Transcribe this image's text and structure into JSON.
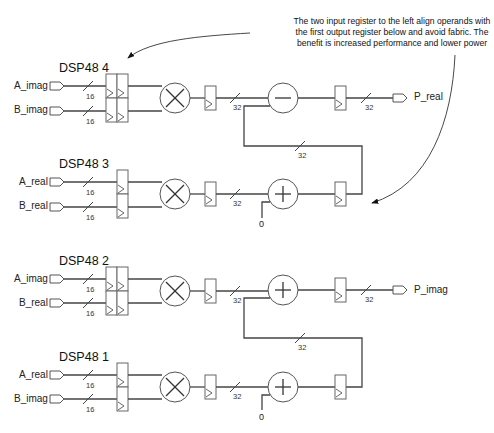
{
  "annotation": {
    "lines": [
      "The two input register to the left align operands with",
      "the first output register below and avoid fabric. The",
      "benefit is increased performance and lower power"
    ]
  },
  "blocks": [
    {
      "title": "DSP48 4",
      "inputs": [
        {
          "name": "A_imag",
          "width": "16"
        },
        {
          "name": "B_imag",
          "width": "16"
        }
      ],
      "input_register_stages": 2,
      "operation": "multiply",
      "product_width": "32",
      "accumulate_operation": "subtract",
      "output": {
        "name": "P_real",
        "width": "32"
      }
    },
    {
      "title": "DSP48 3",
      "inputs": [
        {
          "name": "A_real",
          "width": "16"
        },
        {
          "name": "B_real",
          "width": "16"
        }
      ],
      "input_register_stages": 1,
      "operation": "multiply",
      "product_width": "32",
      "accumulate_operation": "add",
      "carry_in": "0",
      "cascade_width": "32"
    },
    {
      "title": "DSP48 2",
      "inputs": [
        {
          "name": "A_imag",
          "width": "16"
        },
        {
          "name": "B_real",
          "width": "16"
        }
      ],
      "input_register_stages": 2,
      "operation": "multiply",
      "product_width": "32",
      "accumulate_operation": "add",
      "output": {
        "name": "P_imag",
        "width": "32"
      }
    },
    {
      "title": "DSP48 1",
      "inputs": [
        {
          "name": "A_real",
          "width": "16"
        },
        {
          "name": "B_imag",
          "width": "16"
        }
      ],
      "input_register_stages": 1,
      "operation": "multiply",
      "product_width": "32",
      "accumulate_operation": "add",
      "carry_in": "0",
      "cascade_width": "32"
    }
  ],
  "colors": {
    "line": "#444444",
    "block_stroke": "#555555",
    "background": "#ffffff"
  }
}
